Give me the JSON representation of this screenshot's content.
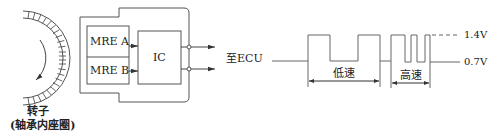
{
  "sensor": {
    "rotor_label": "转子",
    "rotor_sublabel": "(轴承内座圈)",
    "mre_a": "MRE A",
    "mre_b": "MRE B",
    "ic": "IC",
    "output_label": "至ECU"
  },
  "waveform": {
    "low_speed_label": "低速",
    "high_speed_label": "高速",
    "high_level": "1.4V",
    "low_level": "0.7V"
  },
  "colors": {
    "line": "#555555",
    "text": "#222222"
  }
}
